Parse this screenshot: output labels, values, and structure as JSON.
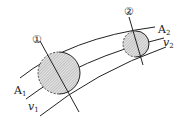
{
  "diagram": {
    "section1": {
      "marker": "①",
      "area_label": "A",
      "area_sub": "1",
      "velocity_label": "v",
      "velocity_sub": "1"
    },
    "section2": {
      "marker": "②",
      "area_label": "A",
      "area_sub": "2",
      "velocity_label": "v",
      "velocity_sub": "2"
    },
    "colors": {
      "stroke": "#222222",
      "hatch_fill": "#c8c8c8",
      "background": "#ffffff"
    }
  }
}
